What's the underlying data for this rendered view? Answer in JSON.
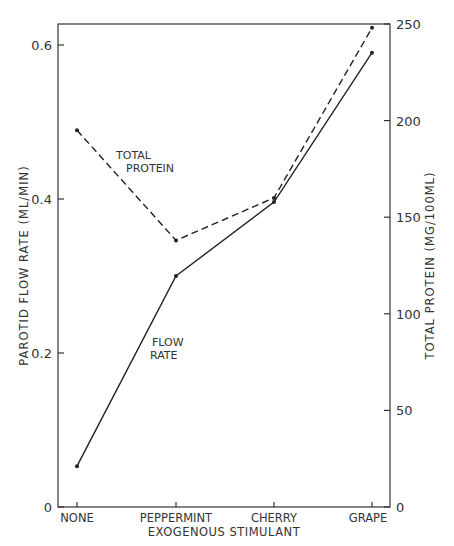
{
  "chart_data": {
    "type": "line",
    "title": "",
    "xlabel": "EXOGENOUS STIMULANT",
    "ylabel": "PAROTID FLOW RATE (ML/MIN)",
    "y2label": "TOTAL PROTEIN (MG/100ML)",
    "categories": [
      "NONE",
      "PEPPERMINT",
      "CHERRY",
      "GRAPE"
    ],
    "ylim": [
      0,
      0.63
    ],
    "y2lim": [
      0,
      250
    ],
    "yticks": [
      "0",
      "0.2",
      "0.4",
      "0.6"
    ],
    "y2ticks": [
      "0",
      "50",
      "100",
      "150",
      "200",
      "250"
    ],
    "grid": false,
    "series": [
      {
        "name": "FLOW RATE",
        "axis": "left",
        "style": "solid",
        "values": [
          0.053,
          0.3,
          0.396,
          0.59
        ]
      },
      {
        "name": "TOTAL PROTEIN",
        "axis": "right",
        "style": "dashed",
        "values": [
          195,
          138,
          160,
          248
        ]
      }
    ],
    "annotations": [
      {
        "text": [
          "TOTAL",
          "PROTEIN"
        ],
        "series": "TOTAL PROTEIN"
      },
      {
        "text": [
          "FLOW",
          "RATE"
        ],
        "series": "FLOW RATE"
      }
    ]
  }
}
